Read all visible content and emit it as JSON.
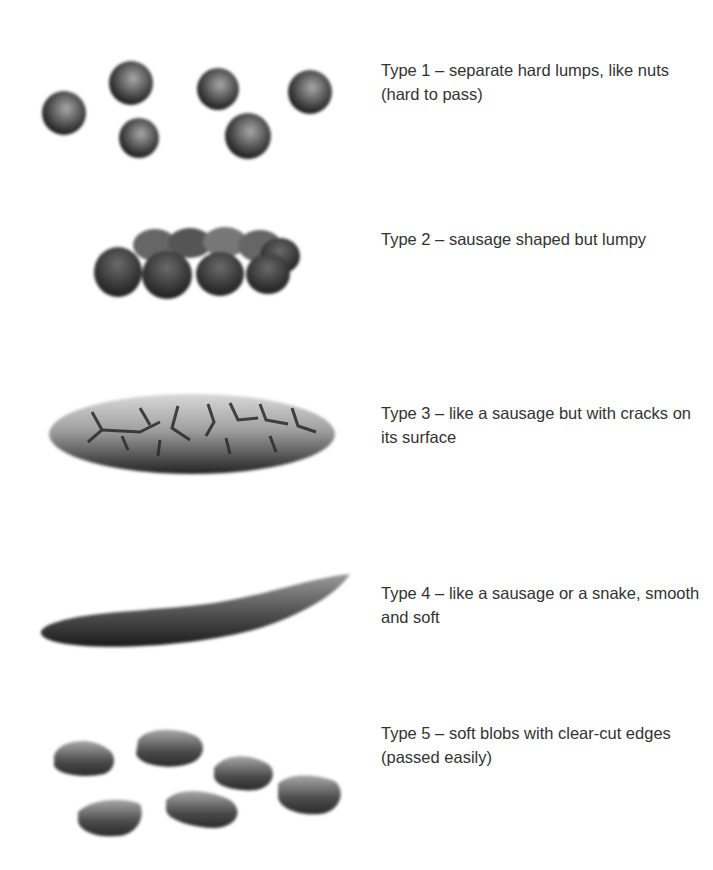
{
  "chart_type": "Bristol stool chart (partial, types 1-5)",
  "items": [
    {
      "type": 1,
      "label": "Type 1 – separate hard lumps, like nuts (hard to pass)",
      "illustration": "separate-hard-lumps-icon"
    },
    {
      "type": 2,
      "label": "Type 2 – sausage shaped but lumpy",
      "illustration": "lumpy-sausage-icon"
    },
    {
      "type": 3,
      "label": "Type 3 – like a sausage but with cracks on its surface",
      "illustration": "cracked-sausage-icon"
    },
    {
      "type": 4,
      "label": "Type 4 – like a sausage or a snake, smooth and soft",
      "illustration": "smooth-snake-icon"
    },
    {
      "type": 5,
      "label": "Type 5 – soft blobs with clear-cut edges (passed easily)",
      "illustration": "soft-blobs-icon"
    }
  ],
  "colors": {
    "text": "#333333",
    "background": "#ffffff",
    "ink_dark": "#1e1e1e",
    "ink_light": "#9a9a9a"
  }
}
